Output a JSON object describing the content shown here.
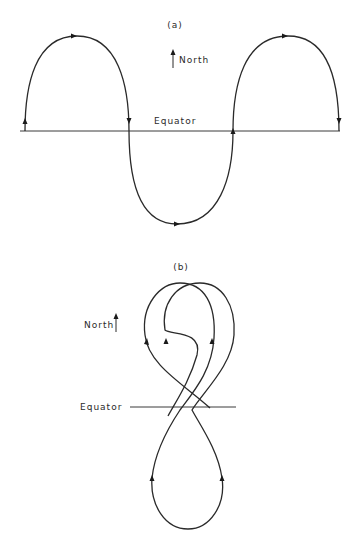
{
  "panels": [
    {
      "id": "a",
      "label": "(a)",
      "north_label": "North",
      "equator_label": "Equator",
      "description": "Sinusoidal-like trajectory oscillating north and south across the equator"
    },
    {
      "id": "b",
      "label": "(b)",
      "north_label": "North",
      "equator_label": "Equator",
      "description": "Figure-eight looping trajectory crossing the equator"
    }
  ],
  "colors": {
    "line": "#2a2a2a",
    "background": "#ffffff"
  }
}
